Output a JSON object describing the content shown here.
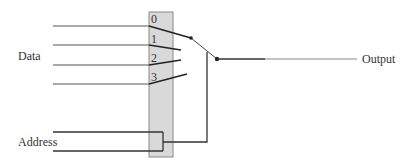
{
  "diagram": {
    "type": "multiplexer",
    "labels": {
      "data": "Data",
      "address": "Address",
      "output": "Output"
    },
    "inputs": [
      {
        "index": "0"
      },
      {
        "index": "1"
      },
      {
        "index": "2"
      },
      {
        "index": "3"
      }
    ],
    "colors": {
      "line": "#333333",
      "thin_line": "#666666",
      "selector_fill": "#d9d9d9",
      "selector_stroke": "#888888"
    }
  }
}
